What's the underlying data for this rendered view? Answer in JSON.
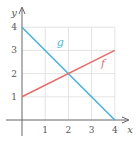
{
  "chart_data": {
    "type": "line",
    "title": "",
    "xlabel": "x",
    "ylabel": "y",
    "xlim": [
      0,
      4
    ],
    "ylim": [
      0,
      4
    ],
    "grid": true,
    "x_ticks": [
      "1",
      "2",
      "3",
      "4"
    ],
    "y_ticks": [
      "1",
      "2",
      "3",
      "4"
    ],
    "series": [
      {
        "name": "g",
        "color": "#4ab3d8",
        "x": [
          0,
          4
        ],
        "y": [
          4,
          0
        ],
        "label_pos": [
          1.5,
          3.2
        ]
      },
      {
        "name": "f",
        "color": "#e0706a",
        "x": [
          0,
          4
        ],
        "y": [
          1,
          3
        ],
        "label_pos": [
          3.4,
          2.3
        ]
      }
    ],
    "intersection": {
      "x": 2,
      "y": 2
    }
  }
}
